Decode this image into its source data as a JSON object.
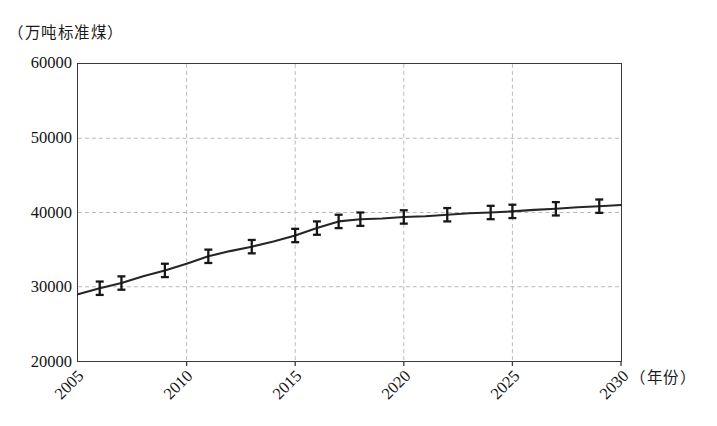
{
  "chart_data": {
    "type": "line",
    "title": "",
    "subtitle": "",
    "ylabel": "（万吨标准煤）",
    "xlabel": "（年份）",
    "xlim": [
      2005,
      2030
    ],
    "ylim": [
      20000,
      60000
    ],
    "grid": true,
    "legend": null,
    "ytick_labels": [
      "60000",
      "50000",
      "40000",
      "30000",
      "20000"
    ],
    "ytick_values": [
      60000,
      50000,
      40000,
      30000,
      20000
    ],
    "xtick_labels": [
      "2005",
      "2010",
      "2015",
      "2020",
      "2025",
      "2030"
    ],
    "xtick_values": [
      2005,
      2010,
      2015,
      2020,
      2025,
      2030
    ],
    "xtick_rotation": -45,
    "series": [
      {
        "name": "能源消费总量",
        "marker": "errorbar",
        "x": [
          2005,
          2006,
          2007,
          2008,
          2009,
          2010,
          2011,
          2012,
          2013,
          2014,
          2015,
          2016,
          2017,
          2018,
          2019,
          2020,
          2021,
          2022,
          2023,
          2024,
          2025,
          2026,
          2027,
          2028,
          2029,
          2030
        ],
        "values": [
          29000,
          29800,
          30500,
          31400,
          32200,
          33100,
          34100,
          34800,
          35400,
          36100,
          36900,
          37900,
          38800,
          39100,
          39200,
          39400,
          39500,
          39700,
          39900,
          40000,
          40150,
          40350,
          40500,
          40700,
          40850,
          41000
        ],
        "errorbar_years": [
          2006,
          2007,
          2009,
          2011,
          2013,
          2015,
          2016,
          2017,
          2018,
          2020,
          2022,
          2024,
          2025,
          2027,
          2029
        ],
        "errorbar_magnitude": 900
      }
    ]
  },
  "axes": {
    "y_unit_caption": "（万吨标准煤）",
    "x_unit_caption": "（年份）"
  }
}
